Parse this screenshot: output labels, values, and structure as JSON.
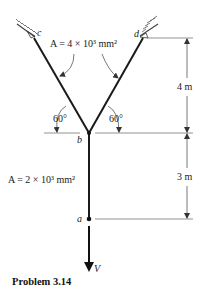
{
  "figure": {
    "caption": "Problem 3.14",
    "nodes": {
      "a": "a",
      "b": "b",
      "c": "c",
      "d": "d"
    },
    "load_label": "V",
    "member_bc_bd_area": "A = 4 × 10³ mm²",
    "member_ab_area": "A = 2 × 10³ mm²",
    "angle_left": "60°",
    "angle_right": "60°",
    "dimension_upper": "4 m",
    "dimension_lower": "3 m"
  },
  "colors": {
    "member": "#1a1a1a",
    "dimension": "#555555",
    "hatch": "#444444"
  }
}
